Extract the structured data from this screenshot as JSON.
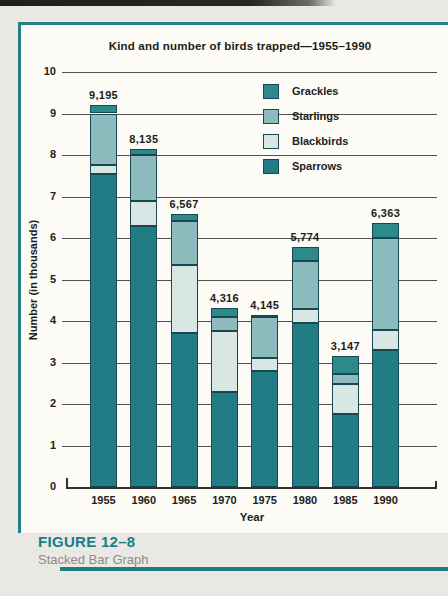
{
  "page": {
    "figure_label": "FIGURE 12–8",
    "figure_caption": "Stacked Bar Graph"
  },
  "colors": {
    "accent_teal": "#238083",
    "grid": "#55534e",
    "segment_outline": "#174750",
    "paper": "#fcfbf6",
    "page_background": "#eae8e2"
  },
  "chart_data": {
    "type": "bar",
    "subtype": "stacked",
    "title": "Kind and number of birds trapped—1955–1990",
    "xlabel": "Year",
    "ylabel": "Number (in thousands)",
    "ylim": [
      0,
      10
    ],
    "yticks": [
      "0",
      "1",
      "2",
      "3",
      "4",
      "5",
      "6",
      "7",
      "8",
      "9",
      "10"
    ],
    "grid": "horizontal",
    "legend_position": "top-right",
    "categories": [
      "1955",
      "1960",
      "1965",
      "1970",
      "1975",
      "1980",
      "1985",
      "1990"
    ],
    "totals": [
      9195,
      8135,
      6567,
      4316,
      4145,
      5774,
      3147,
      6363
    ],
    "totals_labels": [
      "9,195",
      "8,135",
      "6,567",
      "4,316",
      "4,145",
      "5,774",
      "3,147",
      "6,363"
    ],
    "series": [
      {
        "name": "Sparrows",
        "stack_order": "bottom",
        "color": "#217c85",
        "values": [
          7550,
          6300,
          3700,
          2300,
          2800,
          3950,
          1750,
          3300
        ]
      },
      {
        "name": "Blackbirds",
        "color": "#d8e6e4",
        "values": [
          200,
          600,
          1650,
          1450,
          300,
          350,
          720,
          480
        ]
      },
      {
        "name": "Starlings",
        "color": "#8ebcbe",
        "values": [
          1250,
          1100,
          1050,
          350,
          1000,
          1150,
          250,
          2220
        ]
      },
      {
        "name": "Grackles",
        "stack_order": "top",
        "color": "#2d8a8c",
        "values": [
          195,
          135,
          167,
          216,
          45,
          324,
          427,
          363
        ]
      }
    ],
    "legend": [
      {
        "label": "Grackles",
        "color": "#2d8a8c"
      },
      {
        "label": "Starlings",
        "color": "#8ebcbe"
      },
      {
        "label": "Blackbirds",
        "color": "#d8e6e4"
      },
      {
        "label": "Sparrows",
        "color": "#217c85"
      }
    ]
  }
}
